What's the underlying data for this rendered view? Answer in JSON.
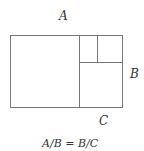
{
  "diagram": {
    "labels": {
      "top": "A",
      "right": "B",
      "bottom": "C"
    },
    "equation": "A/B = B/C",
    "line_color": "#777777"
  }
}
